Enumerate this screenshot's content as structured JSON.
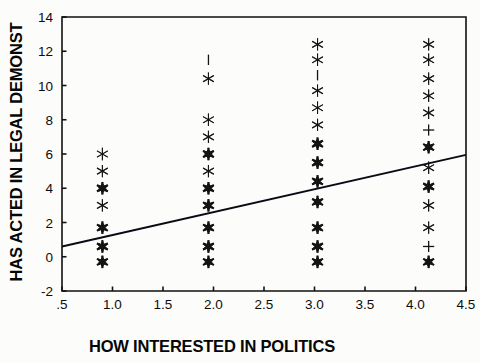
{
  "figure": {
    "background_color": "#fcfcfb",
    "foreground_color": "#111111"
  },
  "axes": {
    "x": {
      "label": "HOW INTERESTED IN POLITICS",
      "ticks": [
        ".5",
        "1.0",
        "1.5",
        "2.0",
        "2.5",
        "3.0",
        "3.5",
        "4.0",
        "4.5"
      ],
      "tick_values": [
        0.5,
        1.0,
        1.5,
        2.0,
        2.5,
        3.0,
        3.5,
        4.0,
        4.5
      ],
      "min": 0.5,
      "max": 4.5
    },
    "y": {
      "label": "HAS ACTED IN LEGAL DEMONST",
      "ticks": [
        "-2",
        "0",
        "2",
        "4",
        "6",
        "8",
        "10",
        "12",
        "14"
      ],
      "tick_values": [
        -2,
        0,
        2,
        4,
        6,
        8,
        10,
        12,
        14
      ],
      "min": -2,
      "max": 14
    }
  },
  "chart_data": {
    "type": "scatter",
    "title": "",
    "xlabel": "HOW INTERESTED IN POLITICS",
    "ylabel": "HAS ACTED IN LEGAL DEMONST",
    "xlim": [
      0.5,
      4.5
    ],
    "ylim": [
      -2,
      14
    ],
    "xticks": [
      0.5,
      1.0,
      1.5,
      2.0,
      2.5,
      3.0,
      3.5,
      4.0,
      4.5
    ],
    "yticks": [
      -2,
      0,
      2,
      4,
      6,
      8,
      10,
      12,
      14
    ],
    "grid": false,
    "legend": false,
    "marker_style": "asterisk",
    "points": [
      {
        "x": 0.9,
        "y": 6.0,
        "weight": "light"
      },
      {
        "x": 0.9,
        "y": 5.0,
        "weight": "light"
      },
      {
        "x": 0.9,
        "y": 4.0,
        "weight": "heavy"
      },
      {
        "x": 0.9,
        "y": 3.0,
        "weight": "light"
      },
      {
        "x": 0.9,
        "y": 1.7,
        "weight": "heavy"
      },
      {
        "x": 0.9,
        "y": 0.6,
        "weight": "heavy"
      },
      {
        "x": 0.9,
        "y": -0.3,
        "weight": "heavy"
      },
      {
        "x": 1.95,
        "y": 11.5,
        "weight": "bar"
      },
      {
        "x": 1.95,
        "y": 10.4,
        "weight": "light"
      },
      {
        "x": 1.95,
        "y": 8.0,
        "weight": "light"
      },
      {
        "x": 1.95,
        "y": 7.0,
        "weight": "light"
      },
      {
        "x": 1.95,
        "y": 6.0,
        "weight": "heavy"
      },
      {
        "x": 1.95,
        "y": 5.0,
        "weight": "light"
      },
      {
        "x": 1.95,
        "y": 4.0,
        "weight": "heavy"
      },
      {
        "x": 1.95,
        "y": 3.0,
        "weight": "heavy"
      },
      {
        "x": 1.95,
        "y": 1.7,
        "weight": "heavy"
      },
      {
        "x": 1.95,
        "y": 0.6,
        "weight": "heavy"
      },
      {
        "x": 1.95,
        "y": -0.3,
        "weight": "heavy"
      },
      {
        "x": 3.03,
        "y": 12.4,
        "weight": "light"
      },
      {
        "x": 3.03,
        "y": 11.5,
        "weight": "light"
      },
      {
        "x": 3.03,
        "y": 10.6,
        "weight": "bar"
      },
      {
        "x": 3.03,
        "y": 9.7,
        "weight": "light"
      },
      {
        "x": 3.03,
        "y": 8.7,
        "weight": "light"
      },
      {
        "x": 3.03,
        "y": 7.7,
        "weight": "light"
      },
      {
        "x": 3.03,
        "y": 6.6,
        "weight": "heavy"
      },
      {
        "x": 3.03,
        "y": 5.5,
        "weight": "heavy"
      },
      {
        "x": 3.03,
        "y": 4.4,
        "weight": "heavy"
      },
      {
        "x": 3.03,
        "y": 3.2,
        "weight": "heavy"
      },
      {
        "x": 3.03,
        "y": 1.7,
        "weight": "heavy"
      },
      {
        "x": 3.03,
        "y": 0.6,
        "weight": "heavy"
      },
      {
        "x": 3.03,
        "y": -0.3,
        "weight": "heavy"
      },
      {
        "x": 4.13,
        "y": 12.4,
        "weight": "light"
      },
      {
        "x": 4.13,
        "y": 11.5,
        "weight": "light"
      },
      {
        "x": 4.13,
        "y": 10.4,
        "weight": "light"
      },
      {
        "x": 4.13,
        "y": 9.4,
        "weight": "light"
      },
      {
        "x": 4.13,
        "y": 8.4,
        "weight": "light"
      },
      {
        "x": 4.13,
        "y": 7.4,
        "weight": "plus"
      },
      {
        "x": 4.13,
        "y": 6.4,
        "weight": "heavy"
      },
      {
        "x": 4.13,
        "y": 5.2,
        "weight": "light"
      },
      {
        "x": 4.13,
        "y": 4.1,
        "weight": "heavy"
      },
      {
        "x": 4.13,
        "y": 3.0,
        "weight": "light"
      },
      {
        "x": 4.13,
        "y": 1.7,
        "weight": "light"
      },
      {
        "x": 4.13,
        "y": 0.6,
        "weight": "plus"
      },
      {
        "x": 4.13,
        "y": -0.3,
        "weight": "heavy"
      }
    ],
    "fit_line": {
      "name": "regression-line",
      "x1": 0.5,
      "y1": 0.6,
      "x2": 4.5,
      "y2": 5.95
    }
  }
}
